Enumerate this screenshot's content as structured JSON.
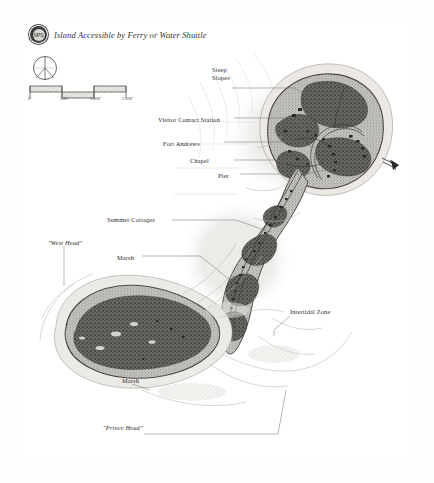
{
  "page": {
    "document_type": "hand-drawn island map",
    "background_color": "#fdfdfc",
    "frame_color": "#c9c9c6"
  },
  "header": {
    "badge_icon": "park-service-badge-icon",
    "badge_text": "NPS",
    "title": "Island Accessible by Ferry or Water Shuttle"
  },
  "compass": {
    "icon": "compass-rose-icon",
    "north_label": ""
  },
  "scale": {
    "icon": "scale-bar-icon",
    "labels": [
      "0'",
      "500'",
      "1000'",
      "1500'"
    ],
    "units": "feet"
  },
  "annotations": [
    {
      "id": "steep-slopes",
      "label": "Steep Slopes",
      "quoted": false
    },
    {
      "id": "visitor-contact-station",
      "label": "Visitor Contact Station",
      "quoted": false
    },
    {
      "id": "fort-andrews",
      "label": "Fort Andrews",
      "quoted": false
    },
    {
      "id": "chapel",
      "label": "Chapel",
      "quoted": false
    },
    {
      "id": "pier",
      "label": "Pier",
      "quoted": false
    },
    {
      "id": "summer-cottages",
      "label": "Summer Cottages",
      "quoted": false
    },
    {
      "id": "west-head",
      "label": "\"West Head\"",
      "quoted": true
    },
    {
      "id": "marsh-north",
      "label": "Marsh",
      "quoted": false
    },
    {
      "id": "intertidal-zone",
      "label": "Intertidal Zone",
      "quoted": false
    },
    {
      "id": "marsh-south",
      "label": "Marsh",
      "quoted": false
    },
    {
      "id": "prince-head",
      "label": "\"Prince Head\"",
      "quoted": true
    }
  ],
  "colors": {
    "ink": "#2d2d2b",
    "land_fill": "#b9b7b1",
    "tree_canopy": "#5e5c57",
    "water": "#ffffff",
    "shoreline": "#6d6b66",
    "leader_line": "#6f6e6a"
  }
}
